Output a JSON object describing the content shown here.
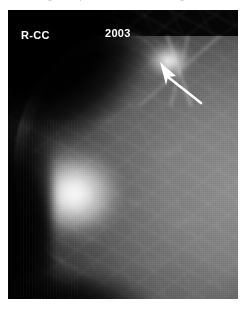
{
  "page": {
    "caption_remnant": "cut-off figure caption text above the image"
  },
  "mammogram": {
    "view_label": "R-CC",
    "year_label": "2003",
    "modality": "mammogram",
    "view": "craniocaudal",
    "laterality": "right",
    "background_color": "#050505",
    "annotation_color": "#ffffff",
    "arrow": {
      "name": "lesion-pointer-arrow",
      "tip_x": 152,
      "tip_y": 52,
      "tail_x": 192,
      "tail_y": 92,
      "points_to": "spiculated density in upper outer quadrant"
    },
    "findings": [
      {
        "name": "spiculated-density",
        "location": "upper breast at arrow tip",
        "appearance": "bright spiculated mass"
      },
      {
        "name": "fibroglandular-tissue",
        "location": "left-central breast",
        "appearance": "dense bright parenchyma"
      }
    ]
  }
}
